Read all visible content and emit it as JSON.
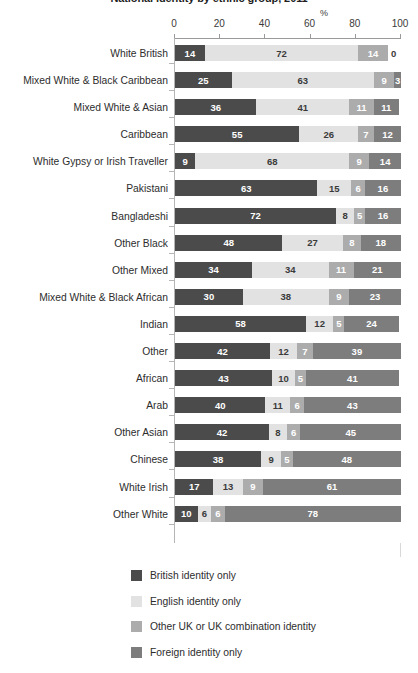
{
  "chart_data": {
    "type": "bar",
    "orientation": "horizontal",
    "stacked": true,
    "title": "National identity by ethnic group, 2011",
    "xlabel": "%",
    "ylabel": "",
    "xlim": [
      0,
      100
    ],
    "xticks": [
      0,
      20,
      40,
      60,
      80,
      100
    ],
    "grid": false,
    "legend_position": "bottom",
    "categories": [
      "White British",
      "Mixed White & Black Caribbean",
      "Mixed White & Asian",
      "Caribbean",
      "White Gypsy or Irish Traveller",
      "Pakistani",
      "Bangladeshi",
      "Other Black",
      "Other Mixed",
      "Mixed White & Black African",
      "Indian",
      "Other",
      "African",
      "Arab",
      "Other Asian",
      "Chinese",
      "White Irish",
      "Other White"
    ],
    "series": [
      {
        "name": "British identity only",
        "color": "#4b4b4b",
        "values": [
          14,
          25,
          36,
          55,
          9,
          63,
          72,
          48,
          34,
          30,
          58,
          42,
          43,
          40,
          42,
          38,
          17,
          10
        ]
      },
      {
        "name": "English identity only",
        "color": "#e2e2e2",
        "values": [
          72,
          63,
          41,
          26,
          68,
          15,
          8,
          27,
          34,
          38,
          12,
          12,
          10,
          11,
          8,
          9,
          13,
          6
        ]
      },
      {
        "name": "Other UK or UK combination identity",
        "color": "#acacac",
        "values": [
          14,
          9,
          11,
          7,
          9,
          6,
          5,
          8,
          11,
          9,
          5,
          7,
          5,
          6,
          6,
          5,
          9,
          6
        ]
      },
      {
        "name": "Foreign identity only",
        "color": "#7d7d7d",
        "values": [
          0,
          3,
          11,
          12,
          14,
          16,
          16,
          18,
          21,
          23,
          24,
          39,
          41,
          43,
          45,
          48,
          61,
          78
        ]
      }
    ]
  },
  "axis": {
    "pct_label": "%",
    "tick_labels": [
      "0",
      "20",
      "40",
      "60",
      "80",
      "100"
    ]
  }
}
